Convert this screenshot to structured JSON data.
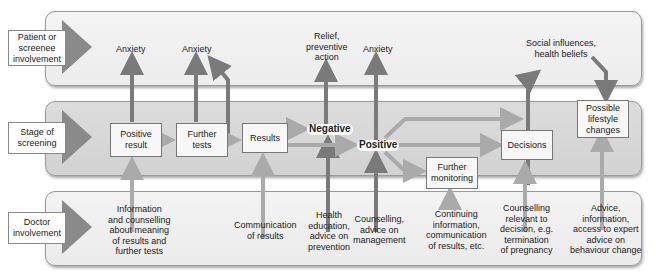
{
  "rows": [
    {
      "id": "patient",
      "label": "Patient or screenee involvement"
    },
    {
      "id": "stage",
      "label": "Stage of screening"
    },
    {
      "id": "doctor",
      "label": "Doctor involvement"
    }
  ],
  "stage_boxes": {
    "positive_result": "Positive result",
    "further_tests": "Further tests",
    "results": "Results",
    "negative": "Negative",
    "positive": "Positive",
    "further_monitoring": "Further monitoring",
    "decisions": "Decisions",
    "lifestyle": "Possible lifestyle changes"
  },
  "patient_labels": {
    "anxiety1": "Anxiety",
    "anxiety2": "Anxiety",
    "relief": "Relief,\npreventive\naction",
    "anxiety3": "Anxiety",
    "social": "Social influences,\nhealth beliefs"
  },
  "doctor_labels": {
    "info": "Information\nand counselling\nabout meaning\nof results and\nfurther tests",
    "communication": "Communication\nof results",
    "health": "Health\neducation,\nadvice on\nprevention",
    "counselling": "Counselling,\nadvice on\nmanagement",
    "continuing": "Continuing\ninformation,\ncommunication\nof results, etc.",
    "relevant": "Counselling\nrelevant to\ndecision, e.g.\ntermination\nof pregnancy",
    "advice": "Advice,\ninformation,\naccess to expert\nadvice on\nbehaviour change"
  },
  "colors": {
    "arrow": "#7a7a7a",
    "arrow_light": "#b5b5b5",
    "box_border": "#777777"
  }
}
